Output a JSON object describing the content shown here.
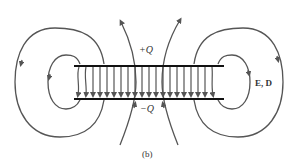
{
  "figure": {
    "caption": "(b)",
    "top_plate_label": "+Q",
    "bottom_plate_label": "−Q",
    "field_label": "E, D",
    "colors": {
      "field_line": "#555555",
      "plate": "#111111",
      "text": "#333333"
    },
    "plate_count": 2,
    "interior_field_arrows": 20,
    "fringe_loops_per_side": 2
  }
}
